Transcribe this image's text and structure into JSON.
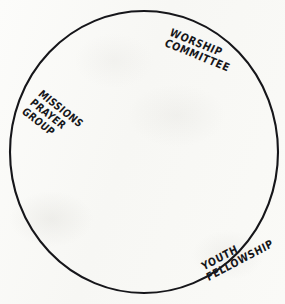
{
  "diagram": {
    "type": "circle-grouping-diagram",
    "background_color": "#fbfbf9",
    "ink_color": "#16161a",
    "shape": {
      "name": "boundary-circle",
      "kind": "ellipse",
      "center_x": 144,
      "center_y": 152,
      "radius_x": 134,
      "radius_y": 141,
      "stroke_width": 2.1,
      "fill": "none"
    },
    "labels": [
      {
        "id": "worship-committee",
        "lines": [
          "WORSHIP",
          "COMMITTEE"
        ],
        "position": "top-right-inner-edge",
        "rotation_deg": 22
      },
      {
        "id": "missions-prayer-group",
        "lines": [
          "MISSIONS",
          "PRAYER",
          "GROUP"
        ],
        "position": "left-inner-edge",
        "rotation_deg": 38
      },
      {
        "id": "youth-fellowship",
        "lines": [
          "YOUTH",
          "FELLOWSHIP"
        ],
        "position": "bottom-right-inner-edge",
        "rotation_deg": -28
      }
    ]
  }
}
